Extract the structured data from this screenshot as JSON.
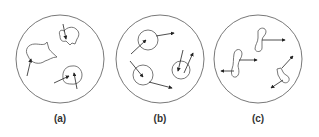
{
  "figure": {
    "panels": [
      {
        "label": "(a)",
        "description": "Irregular deformable shapes with arrows inside a container circle",
        "center_x": 60
      },
      {
        "label": "(b)",
        "description": "Small circles with velocity arrows inside a container circle",
        "center_x": 160
      },
      {
        "label": "(c)",
        "description": "Elongated wiggly shapes with double-headed arrows inside a container circle",
        "center_x": 258
      }
    ]
  },
  "colors": {
    "stroke": "#555555",
    "arrow": "#222222",
    "background": "#ffffff"
  }
}
